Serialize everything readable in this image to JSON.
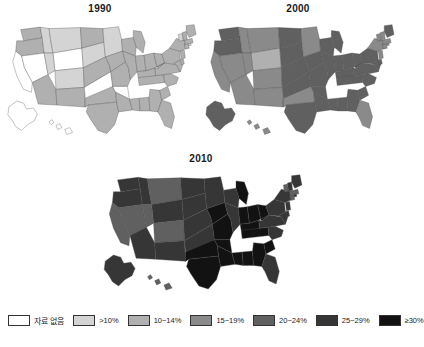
{
  "figure": {
    "kind": "choropleth-map-series",
    "panels": [
      {
        "id": "1990",
        "title": "1990"
      },
      {
        "id": "2000",
        "title": "2000"
      },
      {
        "id": "2010",
        "title": "2010"
      }
    ]
  },
  "legend": {
    "items": [
      {
        "key": "nodata",
        "label": "자료 없음",
        "color": "#ffffff"
      },
      {
        "key": "lt10",
        "label": ">10%",
        "color": "#d4d4d4"
      },
      {
        "key": "10_14",
        "label": "10~14%",
        "color": "#b0b0b0"
      },
      {
        "key": "15_19",
        "label": "15~19%",
        "color": "#8a8a8a"
      },
      {
        "key": "20_24",
        "label": "20~24%",
        "color": "#606060"
      },
      {
        "key": "25_29",
        "label": "25~29%",
        "color": "#363636"
      },
      {
        "key": "ge30",
        "label": "≥30%",
        "color": "#121212"
      }
    ]
  },
  "chart_data": {
    "type": "heatmap",
    "title": "",
    "xlabel": "",
    "ylabel": "",
    "legend_position": "bottom",
    "grid": false,
    "categories": [
      "자료 없음",
      ">10%",
      "10~14%",
      "15~19%",
      "20~24%",
      "25~29%",
      "≥30%"
    ],
    "category_colors": [
      "#ffffff",
      "#d4d4d4",
      "#b0b0b0",
      "#8a8a8a",
      "#606060",
      "#363636",
      "#121212"
    ],
    "panels": [
      "1990",
      "2000",
      "2010"
    ],
    "series": [
      {
        "name": "1990",
        "values": {
          "WA": "10~14%",
          "OR": "10~14%",
          "CA": "자료 없음",
          "NV": "자료 없음",
          "ID": ">10%",
          "MT": ">10%",
          "WY": "자료 없음",
          "UT": ">10%",
          "AZ": "10~14%",
          "CO": ">10%",
          "NM": "10~14%",
          "ND": "10~14%",
          "SD": ">10%",
          "NE": "10~14%",
          "KS": "자료 없음",
          "OK": "10~14%",
          "TX": "10~14%",
          "MN": ">10%",
          "IA": "10~14%",
          "MO": "10~14%",
          "AR": "자료 없음",
          "LA": "10~14%",
          "WI": "10~14%",
          "IL": "10~14%",
          "MS": "10~14%",
          "AL": "10~14%",
          "MI": "10~14%",
          "IN": "10~14%",
          "KY": "10~14%",
          "TN": "10~14%",
          "OH": "10~14%",
          "WV": "10~14%",
          "GA": "10~14%",
          "FL": "10~14%",
          "SC": "10~14%",
          "NC": "10~14%",
          "VA": "10~14%",
          "PA": "10~14%",
          "NY": "10~14%",
          "MD": "10~14%",
          "DE": "10~14%",
          "NJ": "10~14%",
          "CT": "10~14%",
          "RI": ">10%",
          "MA": "10~14%",
          "VT": ">10%",
          "NH": "10~14%",
          "ME": "10~14%",
          "AK": "자료 없음",
          "HI": "자료 없음"
        }
      },
      {
        "name": "2000",
        "values": {
          "WA": "20~24%",
          "OR": "20~24%",
          "CA": "15~19%",
          "NV": "15~19%",
          "ID": "15~19%",
          "MT": "15~19%",
          "WY": "10~14%",
          "UT": "15~19%",
          "AZ": "15~19%",
          "CO": "15~19%",
          "NM": "15~19%",
          "ND": "20~24%",
          "SD": "20~24%",
          "NE": "20~24%",
          "KS": "20~24%",
          "OK": "15~19%",
          "TX": "20~24%",
          "MN": "15~19%",
          "IA": "20~24%",
          "MO": "20~24%",
          "AR": "20~24%",
          "LA": "20~24%",
          "WI": "20~24%",
          "IL": "20~24%",
          "MS": "20~24%",
          "AL": "20~24%",
          "MI": "20~24%",
          "IN": "20~24%",
          "KY": "20~24%",
          "TN": "20~24%",
          "OH": "20~24%",
          "WV": "20~24%",
          "GA": "20~24%",
          "FL": "15~19%",
          "SC": "20~24%",
          "NC": "20~24%",
          "VA": "20~24%",
          "PA": "20~24%",
          "NY": "15~19%",
          "MD": "20~24%",
          "DE": "20~24%",
          "NJ": "15~19%",
          "CT": "15~19%",
          "RI": "15~19%",
          "MA": "15~19%",
          "VT": "15~19%",
          "NH": "15~19%",
          "ME": "20~24%",
          "AK": "20~24%",
          "HI": "15~19%"
        }
      },
      {
        "name": "2010",
        "values": {
          "WA": "25~29%",
          "OR": "25~29%",
          "CA": "20~24%",
          "NV": "20~24%",
          "ID": "25~29%",
          "MT": "20~24%",
          "WY": "25~29%",
          "UT": "20~24%",
          "AZ": "25~29%",
          "CO": "20~24%",
          "NM": "25~29%",
          "ND": "25~29%",
          "SD": "25~29%",
          "NE": "25~29%",
          "KS": "25~29%",
          "OK": "≥30%",
          "TX": "≥30%",
          "MN": "25~29%",
          "IA": "≥30%",
          "MO": "≥30%",
          "AR": "≥30%",
          "LA": "≥30%",
          "WI": "25~29%",
          "IL": "25~29%",
          "MS": "≥30%",
          "AL": "≥30%",
          "MI": "≥30%",
          "IN": "≥30%",
          "KY": "≥30%",
          "TN": "≥30%",
          "OH": "≥30%",
          "WV": "≥30%",
          "GA": "≥30%",
          "FL": "25~29%",
          "SC": "≥30%",
          "NC": "25~29%",
          "VA": "25~29%",
          "PA": "25~29%",
          "NY": "25~29%",
          "MD": "25~29%",
          "DE": "25~29%",
          "NJ": "25~29%",
          "CT": "20~24%",
          "RI": "25~29%",
          "MA": "20~24%",
          "VT": "20~24%",
          "NH": "25~29%",
          "ME": "25~29%",
          "AK": "25~29%",
          "HI": "20~24%"
        }
      }
    ]
  }
}
